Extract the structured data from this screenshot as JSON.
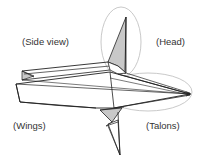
{
  "labels": {
    "side_view": "(Side view)",
    "head": "(Head)",
    "wings": "(Wings)",
    "talons": "(Talons)"
  },
  "colors": {
    "line": "#222222",
    "shade": "#c8c8c8",
    "highlight_ellipse": "#bbbbbb",
    "text": "#333333",
    "background": "#ffffff"
  }
}
